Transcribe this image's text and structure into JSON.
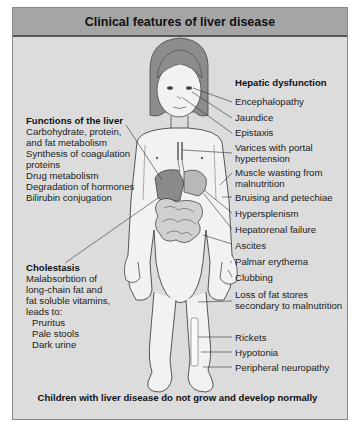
{
  "title": "Clinical features of liver disease",
  "left": {
    "functions": {
      "heading": "Functions of the liver",
      "items": [
        "Carbohydrate, protein,\nand fat metabolism",
        "Synthesis of coagulation\nproteins",
        "Drug metabolism",
        "Degradation of hormones",
        "Bilirubin conjugation"
      ]
    },
    "cholestasis": {
      "heading": "Cholestasis",
      "text": "Malabsorbtion of\nlong-chain fat and\nfat soluble vitamins,\nleads to:",
      "items": [
        "Pruritus",
        "Pale stools",
        "Dark urine"
      ]
    }
  },
  "right": {
    "heading": "Hepatic dysfunction",
    "labels": [
      "Encephalopathy",
      "Jaundice",
      "Epistaxis",
      "Varices with portal\nhypertension",
      "Muscle wasting from\nmalnutrition",
      "Bruising and petechiae",
      "Hypersplenism",
      "Hepatorenal failure",
      "Ascites",
      "Palmar erythema",
      "Clubbing",
      "Loss of fat stores\nsecondary to malnutrition",
      "Rickets",
      "Hypotonia",
      "Peripheral neuropathy"
    ]
  },
  "footer": "Children with liver disease do not grow and develop normally",
  "colors": {
    "panel_bg": "#dcdcdc",
    "title_bg": "#a5a5a5",
    "skin": "#f2f2f2",
    "hair": "#8c8c8c",
    "organ_dark": "#8a8a8a",
    "organ_light": "#b8b8b8"
  }
}
